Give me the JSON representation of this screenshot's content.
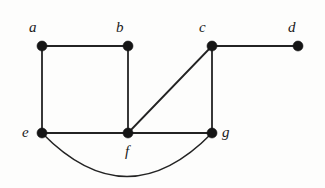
{
  "figure": {
    "width": 325,
    "height": 188,
    "background_color": "#fdfdfc",
    "stroke_color": "#232323",
    "vertex_color": "#151515",
    "label_color": "#1a1a1a"
  },
  "chart_data": {
    "type": "diagram",
    "subtype": "node-link-graph",
    "title": "",
    "directed": false,
    "weighted": false,
    "vertex_count": 7,
    "edge_count": 9,
    "nodes": [
      {
        "id": "a",
        "label": "a",
        "x": 42,
        "y": 46,
        "radius": 5.0,
        "label_dx": -13,
        "label_dy": -26,
        "degree": 2
      },
      {
        "id": "b",
        "label": "b",
        "x": 128,
        "y": 46,
        "radius": 5.0,
        "label_dx": -12,
        "label_dy": -26,
        "degree": 2
      },
      {
        "id": "c",
        "label": "c",
        "x": 212,
        "y": 46,
        "radius": 5.0,
        "label_dx": -13,
        "label_dy": -26,
        "degree": 3
      },
      {
        "id": "d",
        "label": "d",
        "x": 298,
        "y": 46,
        "radius": 5.0,
        "label_dx": -10,
        "label_dy": -26,
        "degree": 1
      },
      {
        "id": "e",
        "label": "e",
        "x": 42,
        "y": 133,
        "radius": 5.0,
        "label_dx": -20,
        "label_dy": -8,
        "degree": 3
      },
      {
        "id": "f",
        "label": "f",
        "x": 128,
        "y": 133,
        "radius": 5.0,
        "label_dx": -3,
        "label_dy": 11,
        "degree": 4
      },
      {
        "id": "g",
        "label": "g",
        "x": 212,
        "y": 133,
        "radius": 5.0,
        "label_dx": 10,
        "label_dy": -8,
        "degree": 4
      }
    ],
    "edges": [
      {
        "id": "a-b",
        "source": "a",
        "target": "b",
        "shape": "straight"
      },
      {
        "id": "a-e",
        "source": "a",
        "target": "e",
        "shape": "straight"
      },
      {
        "id": "b-f",
        "source": "b",
        "target": "f",
        "shape": "straight"
      },
      {
        "id": "c-d",
        "source": "c",
        "target": "d",
        "shape": "straight"
      },
      {
        "id": "c-f",
        "source": "f",
        "target": "c",
        "shape": "straight"
      },
      {
        "id": "c-g",
        "source": "c",
        "target": "g",
        "shape": "straight"
      },
      {
        "id": "e-f",
        "source": "e",
        "target": "f",
        "shape": "straight"
      },
      {
        "id": "f-g",
        "source": "f",
        "target": "g",
        "shape": "straight"
      },
      {
        "id": "e-g",
        "source": "e",
        "target": "g",
        "shape": "curved",
        "curve_control": {
          "x": 127,
          "y": 220
        }
      }
    ]
  }
}
